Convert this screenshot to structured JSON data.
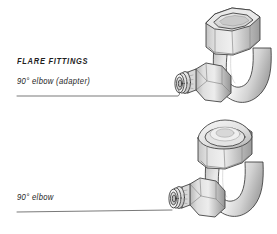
{
  "figure": {
    "kind": "technical-illustration",
    "background_color": "#ffffff",
    "outline_color": "#3a3a3a",
    "metal_light": "#ececec",
    "metal_mid": "#cfcfcf",
    "metal_dark": "#a3a3a3",
    "metal_shadow": "#8e8e8e",
    "leader_color": "#3f3f3f"
  },
  "labels": {
    "heading": "FLARE FITTINGS",
    "adapter_elbow": "90° elbow (adapter)",
    "plain_elbow": "90° elbow"
  },
  "parts": {
    "upper": {
      "name": "90-degree-elbow-adapter",
      "components": [
        "hex-nut",
        "curved-elbow-tube",
        "flare-adapter-nut",
        "flare-seat-rings"
      ]
    },
    "lower": {
      "name": "90-degree-elbow",
      "components": [
        "domed-hex-nut",
        "curved-elbow-tube",
        "flare-nut",
        "flare-seat-rings"
      ]
    }
  },
  "leader_lines": {
    "upper": {
      "from_x": 17,
      "from_y": 96,
      "to_x": 178,
      "to_y": 96
    },
    "lower": {
      "from_x": 17,
      "from_y": 212,
      "to_x": 176,
      "to_y": 209
    }
  }
}
